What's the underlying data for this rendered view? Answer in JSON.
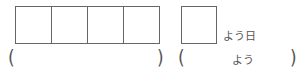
{
  "answer_boxes": {
    "count": 4
  },
  "day_box": {
    "suffix": "よう日"
  },
  "brackets": {
    "left_group": {
      "open": "(",
      "close": ")"
    },
    "right_group": {
      "open": "(",
      "hint": "よう",
      "close": ")"
    }
  }
}
